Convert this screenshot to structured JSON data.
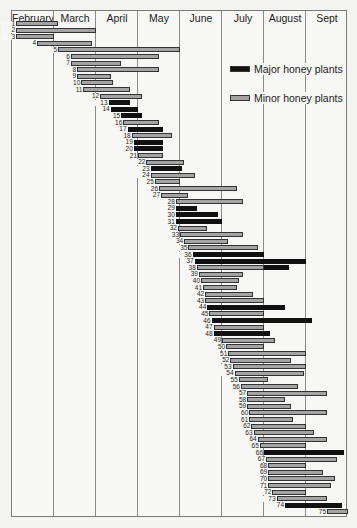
{
  "chart_data": {
    "type": "bar",
    "subtype": "gantt",
    "title": "",
    "xlabel": "",
    "ylabel": "",
    "months": [
      "February",
      "March",
      "April",
      "May",
      "June",
      "July",
      "August",
      "Sept"
    ],
    "x_unit": "month offset from start of February (0 = Feb 1, 8 = end of Sept)",
    "legend": [
      {
        "name": "Major honey plants",
        "color": "#111111",
        "key": "major"
      },
      {
        "name": "Minor honey plants",
        "color": "#a3a3a3",
        "key": "minor"
      }
    ],
    "bars": [
      {
        "id": 1,
        "type": "minor",
        "start": 0.1,
        "end": 1.1
      },
      {
        "id": 2,
        "type": "minor",
        "start": 0.1,
        "end": 2.0
      },
      {
        "id": 3,
        "type": "minor",
        "start": 0.1,
        "end": 1.0
      },
      {
        "id": 4,
        "type": "minor",
        "start": 0.6,
        "end": 1.9
      },
      {
        "id": 5,
        "type": "minor",
        "start": 1.1,
        "end": 4.0
      },
      {
        "id": 6,
        "type": "minor",
        "start": 1.4,
        "end": 3.5
      },
      {
        "id": 7,
        "type": "minor",
        "start": 1.4,
        "end": 2.6
      },
      {
        "id": 8,
        "type": "minor",
        "start": 1.55,
        "end": 3.5
      },
      {
        "id": 9,
        "type": "minor",
        "start": 1.55,
        "end": 2.35
      },
      {
        "id": 10,
        "type": "minor",
        "start": 1.65,
        "end": 2.4
      },
      {
        "id": 11,
        "type": "minor",
        "start": 1.7,
        "end": 2.8
      },
      {
        "id": 12,
        "type": "minor",
        "start": 2.1,
        "end": 3.1
      },
      {
        "id": 13,
        "type": "major",
        "start": 2.3,
        "end": 2.8
      },
      {
        "id": 14,
        "type": "major",
        "start": 2.35,
        "end": 3.0
      },
      {
        "id": 15,
        "type": "major",
        "start": 2.6,
        "end": 3.1
      },
      {
        "id": 16,
        "type": "minor",
        "start": 2.65,
        "end": 3.5
      },
      {
        "id": 17,
        "type": "major",
        "start": 2.75,
        "end": 3.6
      },
      {
        "id": 18,
        "type": "minor",
        "start": 2.85,
        "end": 3.8
      },
      {
        "id": 19,
        "type": "major",
        "start": 2.9,
        "end": 3.6
      },
      {
        "id": 20,
        "type": "major",
        "start": 2.9,
        "end": 3.6
      },
      {
        "id": 21,
        "type": "minor",
        "start": 3.0,
        "end": 3.6
      },
      {
        "id": 22,
        "type": "minor",
        "start": 3.2,
        "end": 4.1
      },
      {
        "id": 23,
        "type": "major",
        "start": 3.3,
        "end": 4.05
      },
      {
        "id": 24,
        "type": "minor",
        "start": 3.3,
        "end": 4.35
      },
      {
        "id": 25,
        "type": "minor",
        "start": 3.4,
        "end": 4.0
      },
      {
        "id": 26,
        "type": "minor",
        "start": 3.5,
        "end": 5.35
      },
      {
        "id": 27,
        "type": "minor",
        "start": 3.55,
        "end": 4.2
      },
      {
        "id": 28,
        "type": "minor",
        "start": 3.9,
        "end": 5.5
      },
      {
        "id": 29,
        "type": "major",
        "start": 3.9,
        "end": 4.4
      },
      {
        "id": 30,
        "type": "major",
        "start": 3.9,
        "end": 4.9
      },
      {
        "id": 31,
        "type": "major",
        "start": 3.9,
        "end": 5.0
      },
      {
        "id": 32,
        "type": "minor",
        "start": 3.95,
        "end": 4.65
      },
      {
        "id": 33,
        "type": "minor",
        "start": 4.0,
        "end": 5.5
      },
      {
        "id": 34,
        "type": "minor",
        "start": 4.1,
        "end": 5.15
      },
      {
        "id": 35,
        "type": "minor",
        "start": 4.2,
        "end": 5.85
      },
      {
        "id": 36,
        "type": "major",
        "start": 4.3,
        "end": 6.0
      },
      {
        "id": 37,
        "type": "major",
        "start": 4.35,
        "end": 7.0
      },
      {
        "id": 38,
        "type": "minor",
        "start": 4.4,
        "end": 6.0,
        "major_extension_end": 6.6
      },
      {
        "id": 39,
        "type": "minor",
        "start": 4.45,
        "end": 5.5
      },
      {
        "id": 40,
        "type": "minor",
        "start": 4.5,
        "end": 5.4
      },
      {
        "id": 41,
        "type": "minor",
        "start": 4.55,
        "end": 5.35
      },
      {
        "id": 42,
        "type": "minor",
        "start": 4.6,
        "end": 5.75
      },
      {
        "id": 43,
        "type": "minor",
        "start": 4.6,
        "end": 6.0
      },
      {
        "id": 44,
        "type": "major",
        "start": 4.65,
        "end": 6.5
      },
      {
        "id": 45,
        "type": "minor",
        "start": 4.7,
        "end": 6.0
      },
      {
        "id": 46,
        "type": "major",
        "start": 4.75,
        "end": 7.15
      },
      {
        "id": 47,
        "type": "minor",
        "start": 4.8,
        "end": 6.0
      },
      {
        "id": 48,
        "type": "major",
        "start": 4.8,
        "end": 6.15
      },
      {
        "id": 49,
        "type": "minor",
        "start": 5.0,
        "end": 6.25
      },
      {
        "id": 50,
        "type": "minor",
        "start": 5.1,
        "end": 6.0
      },
      {
        "id": 51,
        "type": "minor",
        "start": 5.15,
        "end": 7.0
      },
      {
        "id": 52,
        "type": "minor",
        "start": 5.2,
        "end": 6.65
      },
      {
        "id": 53,
        "type": "minor",
        "start": 5.25,
        "end": 7.0
      },
      {
        "id": 54,
        "type": "minor",
        "start": 5.3,
        "end": 6.95
      },
      {
        "id": 55,
        "type": "minor",
        "start": 5.4,
        "end": 6.1
      },
      {
        "id": 56,
        "type": "minor",
        "start": 5.45,
        "end": 6.8
      },
      {
        "id": 57,
        "type": "minor",
        "start": 5.6,
        "end": 7.5
      },
      {
        "id": 58,
        "type": "minor",
        "start": 5.6,
        "end": 6.5
      },
      {
        "id": 59,
        "type": "minor",
        "start": 5.6,
        "end": 6.65
      },
      {
        "id": 60,
        "type": "minor",
        "start": 5.65,
        "end": 7.5
      },
      {
        "id": 61,
        "type": "minor",
        "start": 5.65,
        "end": 6.7
      },
      {
        "id": 62,
        "type": "minor",
        "start": 5.7,
        "end": 7.0
      },
      {
        "id": 63,
        "type": "minor",
        "start": 5.75,
        "end": 7.2
      },
      {
        "id": 64,
        "type": "minor",
        "start": 5.85,
        "end": 7.5
      },
      {
        "id": 65,
        "type": "minor",
        "start": 5.9,
        "end": 7.0
      },
      {
        "id": 66,
        "type": "major",
        "start": 6.0,
        "end": 7.9
      },
      {
        "id": 67,
        "type": "minor",
        "start": 6.05,
        "end": 7.75
      },
      {
        "id": 68,
        "type": "minor",
        "start": 6.1,
        "end": 7.0
      },
      {
        "id": 69,
        "type": "minor",
        "start": 6.1,
        "end": 7.4
      },
      {
        "id": 70,
        "type": "minor",
        "start": 6.1,
        "end": 7.7
      },
      {
        "id": 71,
        "type": "minor",
        "start": 6.1,
        "end": 7.6
      },
      {
        "id": 72,
        "type": "minor",
        "start": 6.2,
        "end": 7.0
      },
      {
        "id": 73,
        "type": "minor",
        "start": 6.3,
        "end": 7.5
      },
      {
        "id": 74,
        "type": "major",
        "start": 6.5,
        "end": 7.85
      },
      {
        "id": 75,
        "type": "minor",
        "start": 7.5,
        "end": 8.0
      }
    ]
  }
}
